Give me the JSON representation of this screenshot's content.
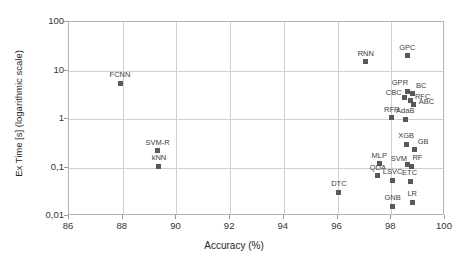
{
  "chart_data": {
    "type": "scatter",
    "title": "",
    "xlabel": "Accuracy (%)",
    "ylabel": "Ex Time [s] (logarithmic scale)",
    "xlim": [
      86,
      100
    ],
    "ylim": [
      0.01,
      100
    ],
    "yscale": "log",
    "xticks": [
      "86",
      "88",
      "90",
      "92",
      "94",
      "96",
      "98",
      "100"
    ],
    "yticks": [
      "0,01",
      "0,1",
      "1",
      "10",
      "100"
    ],
    "grid": true,
    "legend": "none",
    "marker_color": "#595959",
    "points": [
      {
        "label": "FCNN",
        "x": 87.9,
        "y": 5.5,
        "lx": 0,
        "ly": -9
      },
      {
        "label": "SVM-R",
        "x": 89.3,
        "y": 0.22,
        "lx": 0,
        "ly": -9
      },
      {
        "label": "kNN",
        "x": 89.35,
        "y": 0.105,
        "lx": 0,
        "ly": -9
      },
      {
        "label": "RNN",
        "x": 97.05,
        "y": 15.0,
        "lx": 0,
        "ly": -9
      },
      {
        "label": "GPC",
        "x": 98.6,
        "y": 20.0,
        "lx": 0,
        "ly": -9
      },
      {
        "label": "GPR",
        "x": 98.62,
        "y": 3.7,
        "lx": -8,
        "ly": -9
      },
      {
        "label": "BC",
        "x": 98.78,
        "y": 3.4,
        "lx": 9,
        "ly": -8
      },
      {
        "label": "CBC",
        "x": 98.5,
        "y": 2.75,
        "lx": -11,
        "ly": -6
      },
      {
        "label": "RFC",
        "x": 98.72,
        "y": 2.45,
        "lx": 12,
        "ly": -4
      },
      {
        "label": "ABC",
        "x": 98.83,
        "y": 1.95,
        "lx": 13,
        "ly": -4
      },
      {
        "label": "RFR",
        "x": 98.02,
        "y": 1.05,
        "lx": 0,
        "ly": -9
      },
      {
        "label": "AdaB",
        "x": 98.52,
        "y": 1.0,
        "lx": 0,
        "ly": -9
      },
      {
        "label": "XGB",
        "x": 98.55,
        "y": 0.3,
        "lx": 0,
        "ly": -9
      },
      {
        "label": "GB",
        "x": 98.85,
        "y": 0.24,
        "lx": 9,
        "ly": -8
      },
      {
        "label": "MLP",
        "x": 97.55,
        "y": 0.12,
        "lx": 0,
        "ly": -9
      },
      {
        "label": "SVM",
        "x": 98.62,
        "y": 0.115,
        "lx": -9,
        "ly": -7
      },
      {
        "label": "RF",
        "x": 98.75,
        "y": 0.105,
        "lx": 6,
        "ly": -9
      },
      {
        "label": "QDA",
        "x": 97.5,
        "y": 0.068,
        "lx": 0,
        "ly": -9
      },
      {
        "label": "LSVC",
        "x": 98.05,
        "y": 0.055,
        "lx": 0,
        "ly": -9
      },
      {
        "label": "ETC",
        "x": 98.72,
        "y": 0.052,
        "lx": -1,
        "ly": -9
      },
      {
        "label": "DTC",
        "x": 96.05,
        "y": 0.031,
        "lx": 0,
        "ly": -9
      },
      {
        "label": "GNB",
        "x": 98.05,
        "y": 0.016,
        "lx": 0,
        "ly": -9
      },
      {
        "label": "LR",
        "x": 98.78,
        "y": 0.019,
        "lx": 0,
        "ly": -9
      }
    ]
  }
}
